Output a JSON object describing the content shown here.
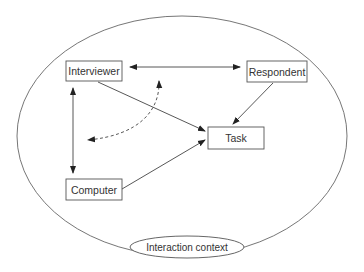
{
  "diagram": {
    "type": "concept-diagram",
    "outer_context": {
      "label": "Interaction context",
      "cx": 182,
      "cy": 136,
      "rx": 165,
      "ry": 120
    },
    "nodes": [
      {
        "id": "interviewer",
        "label": "Interviewer",
        "x": 66,
        "y": 61,
        "w": 56,
        "h": 20
      },
      {
        "id": "respondent",
        "label": "Respondent",
        "x": 247,
        "y": 61,
        "w": 60,
        "h": 21
      },
      {
        "id": "task",
        "label": "Task",
        "x": 208,
        "y": 127,
        "w": 56,
        "h": 22
      },
      {
        "id": "computer",
        "label": "Computer",
        "x": 66,
        "y": 179,
        "w": 56,
        "h": 21
      }
    ],
    "edges": [
      {
        "from": "interviewer",
        "to": "respondent",
        "style": "solid",
        "direction": "both"
      },
      {
        "from": "interviewer",
        "to": "task",
        "style": "solid",
        "direction": "forward"
      },
      {
        "from": "respondent",
        "to": "task",
        "style": "solid",
        "direction": "forward"
      },
      {
        "from": "computer",
        "to": "task",
        "style": "solid",
        "direction": "forward"
      },
      {
        "from": "interviewer",
        "to": "computer",
        "style": "solid",
        "direction": "both"
      },
      {
        "from": "interviewer-computer-link",
        "to": "interviewer-respondent-link",
        "style": "dashed-curve",
        "direction": "both"
      }
    ],
    "colors": {
      "line": "#555555",
      "text": "#333333",
      "background": "#ffffff"
    }
  }
}
